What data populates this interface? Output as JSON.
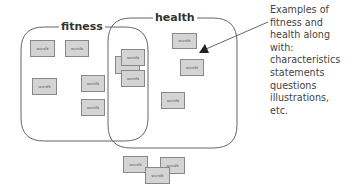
{
  "groups": {
    "fitness": {
      "label": "fitness"
    },
    "health": {
      "label": "health"
    }
  },
  "card_text": "words",
  "cards": {
    "fitness_only": [
      "words",
      "words",
      "words",
      "words",
      "words"
    ],
    "overlap": [
      "words",
      "words",
      "words"
    ],
    "health_only": [
      "words",
      "words",
      "words"
    ],
    "outside": [
      "words",
      "words",
      "words"
    ]
  },
  "annotation": {
    "lines": [
      "Examples of",
      "fitness and",
      "health along",
      "with:",
      "characteristics",
      "statements",
      "questions",
      "illustrations,",
      "etc."
    ]
  },
  "colors": {
    "outline": "#666666",
    "card_fill": "#d4d4d4",
    "card_border": "#888888",
    "text": "#444444"
  }
}
